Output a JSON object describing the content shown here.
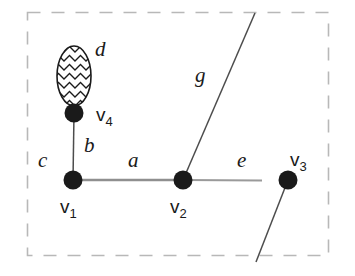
{
  "figure": {
    "background_color": "#ffffff",
    "ink_color": "#1a1a1a",
    "boundary": {
      "name": "dashed-region-boundary",
      "style": "dashed",
      "color": "#b3b3b3",
      "x": 27,
      "y": 12,
      "width": 302,
      "height": 244
    },
    "vertices": [
      {
        "id": "v1",
        "label": "v",
        "subscript": "1",
        "cx": 73,
        "cy": 180,
        "r": 9,
        "label_x": 62,
        "label_y": 210
      },
      {
        "id": "v2",
        "label": "v",
        "subscript": "2",
        "cx": 183,
        "cy": 180,
        "r": 9,
        "label_x": 172,
        "label_y": 210
      },
      {
        "id": "v3",
        "label": "v",
        "subscript": "3",
        "cx": 288,
        "cy": 180,
        "r": 9,
        "label_x": 292,
        "label_y": 165
      },
      {
        "id": "v4",
        "label": "v",
        "subscript": "4",
        "cx": 74,
        "cy": 113,
        "r": 9,
        "label_x": 96,
        "label_y": 120
      }
    ],
    "edges": [
      {
        "id": "a",
        "label": "a",
        "kind": "edge",
        "from": "v1",
        "to": "v2",
        "label_x": 133,
        "label_y": 166,
        "color": "#8c8c8c"
      },
      {
        "id": "b",
        "label": "b",
        "kind": "edge",
        "from": "v1",
        "to": "v4",
        "label_x": 84,
        "label_y": 152,
        "color": "#4d4d4d"
      },
      {
        "id": "c",
        "label": "c",
        "kind": "half-edge",
        "from": "v1",
        "label_x": 38,
        "label_y": 166,
        "color": "#4d4d4d"
      },
      {
        "id": "d",
        "label": "d",
        "kind": "loop",
        "from": "v4",
        "label_x": 95,
        "label_y": 56,
        "color": "#1a1a1a",
        "fill_pattern": "zigzag"
      },
      {
        "id": "e",
        "label": "e",
        "kind": "half-edge",
        "from": "v2",
        "label_x": 237,
        "label_y": 166,
        "color": "#8c8c8c"
      },
      {
        "id": "g",
        "label": "g",
        "kind": "half-edge",
        "from": "v2",
        "label_x": 195,
        "label_y": 82,
        "color": "#4d4d4d"
      },
      {
        "id": "v3-dangling",
        "label": "",
        "kind": "half-edge",
        "from": "v3",
        "label_x": 0,
        "label_y": 0,
        "color": "#4d4d4d"
      }
    ],
    "loop": {
      "name": "loop-d",
      "cx": 74,
      "cy": 76,
      "rx": 17,
      "ry": 30
    }
  }
}
